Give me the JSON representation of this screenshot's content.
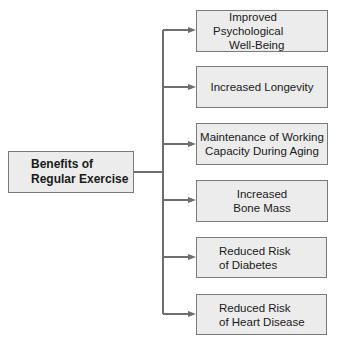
{
  "root": {
    "line1": "Benefits of",
    "line2": "Regular Exercise"
  },
  "benefits": [
    {
      "line1": "Improved Psychological",
      "line2": "Well-Being"
    },
    {
      "line1": "Increased Longevity",
      "line2": ""
    },
    {
      "line1": "Maintenance of Working",
      "line2": "Capacity During Aging"
    },
    {
      "line1": "Increased",
      "line2": "Bone Mass"
    },
    {
      "line1": "Reduced Risk",
      "line2": "of Diabetes"
    },
    {
      "line1": "Reduced Risk",
      "line2": "of Heart Disease"
    }
  ],
  "colors": {
    "box_fill": "#ececec",
    "box_border": "#7a7a7a",
    "connector": "#6e6e6e"
  }
}
